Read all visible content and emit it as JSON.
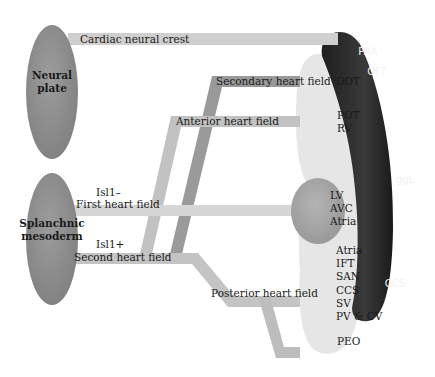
{
  "colors": {
    "origin_fill": "#8f8f8f",
    "neural_crest_band": "#cfcfcf",
    "secondary_band": "#9a9a9a",
    "anterior_band": "#c2c2c2",
    "first_band": "#d6d6d6",
    "second_band": "#c4c4c4",
    "posterior_band": "#bdbdbd",
    "heart_light": "#e6e6e6",
    "lv_blob": "#a8a8a8",
    "dark_arc": "#2b2b2b"
  },
  "sources": [
    {
      "id": "neural-plate",
      "lines": [
        "Neural",
        "plate"
      ]
    },
    {
      "id": "splanchnic-mesoderm",
      "lines": [
        "Splanchnic",
        "mesoderm"
      ]
    }
  ],
  "pathways": {
    "cardiac_neural_crest": "Cardiac neural crest",
    "secondary_heart_field": "Secondary heart field",
    "anterior_heart_field": "Anterior heart field",
    "isl1_minus": "Isl1–",
    "first_heart_field": "First heart field",
    "isl1_plus": "Isl1+",
    "second_heart_field": "Second heart field",
    "posterior_heart_field": "Posterior heart field"
  },
  "heart_regions": {
    "arc_labels": [
      "PAA",
      "OFT",
      "ggL",
      "CCS"
    ],
    "anterior_upper": [
      "DOT"
    ],
    "anterior_lower": [
      "POT",
      "RV"
    ],
    "first_field": [
      "LV",
      "AVC",
      "Atria"
    ],
    "posterior": [
      "Atria",
      "IFT",
      "SAN",
      "CCS",
      "SV",
      "PV & CV"
    ],
    "epicardium": [
      "PEO"
    ]
  }
}
